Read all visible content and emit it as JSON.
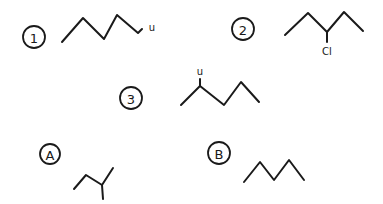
{
  "diagram": {
    "type": "skeletal-structures",
    "colors": {
      "ink": "#1a1a1a",
      "background": "#ffffff"
    },
    "structures": [
      {
        "id": "1",
        "label": "1",
        "circle": {
          "cx": 34,
          "cy": 37,
          "r": 11
        },
        "bonds": "62,42 83,18 104,39 117,15 138,33 142,29",
        "substituent": {
          "text": "Cl",
          "x": 152,
          "y": 27,
          "display": "u"
        }
      },
      {
        "id": "2",
        "label": "2",
        "circle": {
          "cx": 243,
          "cy": 29,
          "r": 11
        },
        "bonds": "285,35 308,13 327,32 344,12 363,31",
        "branch": "327,32 327,42",
        "substituent": {
          "text": "Cl",
          "x": 327,
          "y": 51,
          "display": "Cl"
        }
      },
      {
        "id": "3",
        "label": "3",
        "circle": {
          "cx": 131,
          "cy": 98,
          "r": 11
        },
        "bonds": "181,105 200,86 224,105 241,82 259,102",
        "branch": "200,86 200,79",
        "substituent": {
          "text": "Cl",
          "x": 200,
          "y": 71,
          "display": "u"
        }
      },
      {
        "id": "A",
        "label": "A",
        "circle": {
          "cx": 50,
          "cy": 154,
          "r": 10
        },
        "bonds": "74,189 86,175 102,185 113,168",
        "branch": "102,185 103,199"
      },
      {
        "id": "B",
        "label": "B",
        "circle": {
          "cx": 219,
          "cy": 153,
          "r": 11
        },
        "bonds": "244,182 260,162 274,180 289,160 304,180"
      }
    ]
  }
}
